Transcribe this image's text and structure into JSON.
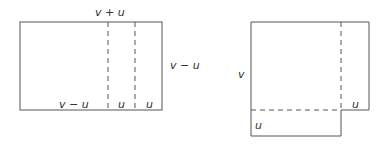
{
  "left_diagram": {
    "top_label": "v + u",
    "right_label": "v − u",
    "bottom_labels": [
      "v − u",
      "u",
      "u"
    ]
  },
  "right_diagram": {
    "left_label": "v",
    "right_inner_label": "u",
    "bottom_inner_label": "u"
  },
  "colors": {
    "stroke": "#555555",
    "text": "#333333"
  }
}
